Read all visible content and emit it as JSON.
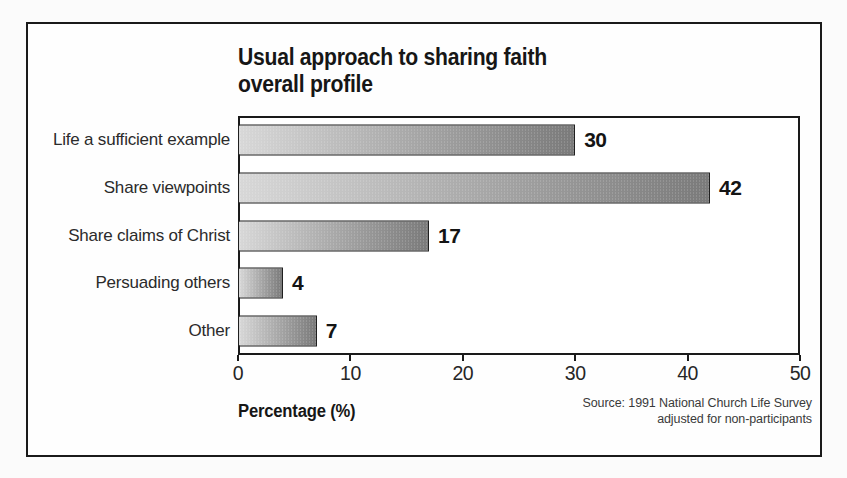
{
  "figure": {
    "title_line1": "Usual approach to sharing faith",
    "title_line2": "overall profile",
    "xaxis_label": "Percentage (%)",
    "source_line1": "Source: 1991 National Church Life Survey",
    "source_line2": "adjusted for non-participants"
  },
  "colors": {
    "ink": "#1a1a1a",
    "bar_gradient_start": "#d8d8d8",
    "bar_gradient_end": "#7a7a7a",
    "background": "#fefefe"
  },
  "chart_data": {
    "type": "bar",
    "orientation": "horizontal",
    "title": "Usual approach to sharing faith overall profile",
    "categories": [
      "Life a sufficient example",
      "Share viewpoints",
      "Share claims of Christ",
      "Persuading others",
      "Other"
    ],
    "values": [
      30,
      42,
      17,
      4,
      7
    ],
    "xlabel": "Percentage (%)",
    "ylabel": "",
    "xlim": [
      0,
      50
    ],
    "xticks": [
      0,
      10,
      20,
      30,
      40,
      50
    ],
    "grid": false,
    "legend": false,
    "data_labels": true,
    "source": "Source: 1991 National Church Life Survey adjusted for non-participants"
  }
}
